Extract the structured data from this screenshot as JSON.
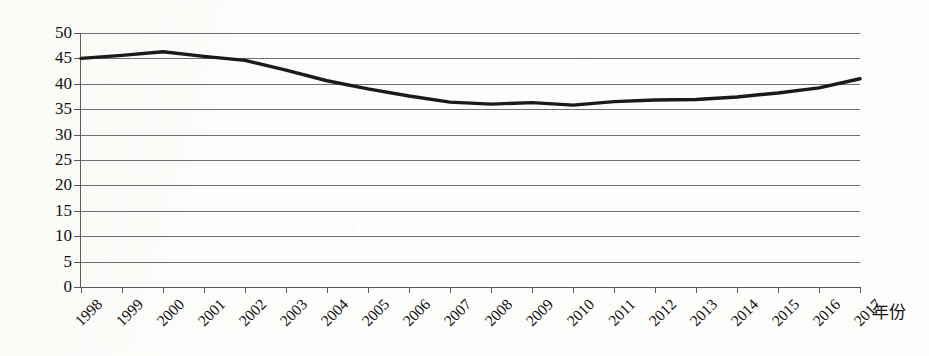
{
  "chart_data": {
    "type": "line",
    "title": "",
    "xlabel": "年份",
    "ylabel": "",
    "grid": true,
    "legend": false,
    "xlim": [
      1998,
      2017
    ],
    "ylim": [
      0,
      50
    ],
    "ytick_step": 5,
    "categories": [
      "1998",
      "1999",
      "2000",
      "2001",
      "2002",
      "2003",
      "2004",
      "2005",
      "2006",
      "2007",
      "2008",
      "2009",
      "2010",
      "2011",
      "2012",
      "2013",
      "2014",
      "2015",
      "2016",
      "2017"
    ],
    "yticks": [
      "0",
      "5",
      "10",
      "15",
      "20",
      "25",
      "30",
      "35",
      "40",
      "45",
      "50"
    ],
    "series": [
      {
        "name": "",
        "color": "#1a1a1a",
        "values": [
          45.0,
          45.6,
          46.3,
          45.4,
          44.6,
          42.7,
          40.6,
          39.0,
          37.6,
          36.4,
          36.0,
          36.3,
          35.8,
          36.5,
          36.8,
          36.9,
          37.4,
          38.2,
          39.2,
          41.0
        ]
      }
    ]
  },
  "axis": {
    "x_title": "年份"
  }
}
